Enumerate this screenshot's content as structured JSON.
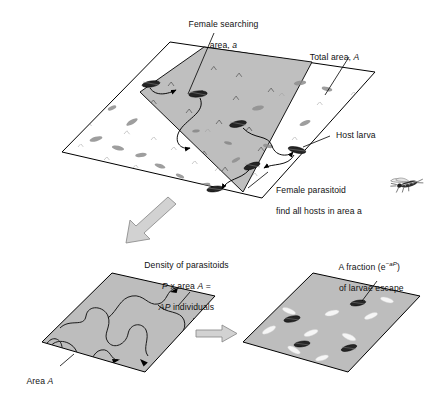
{
  "figure": {
    "title_hidden": "",
    "domain": "scientific-diagram",
    "colors": {
      "background": "#ffffff",
      "line": "#000000",
      "plane_fill_light": "#ffffff",
      "plane_fill_shaded": "#b9b9b9",
      "plane_fill_mid": "#bdbdbd",
      "arrow_fill": "#d0d0d0",
      "arrow_stroke": "#7a7a7a",
      "larva_dark": "#2a2a2a",
      "larva_light": "#f4f4f4",
      "larva_grey": "#9a9a9a"
    }
  },
  "labels": {
    "female_searching_line1": "Female searching",
    "female_searching_line2_pre": "area, ",
    "female_searching_line2_var": "a",
    "total_area_pre": "Total area, ",
    "total_area_var": "A",
    "host_larva": "Host larva",
    "female_parasitoid_line1": "Female parasitoid",
    "female_parasitoid_line2": "find all hosts in area a",
    "density_line1": "Density of parasitoids",
    "density_line2_var1": "P",
    "density_line2_mid": " x area ",
    "density_line2_var2": "A",
    "density_line2_end": " =",
    "density_line3_var": "AP",
    "density_line3_end": " individuals",
    "area_a_pre": "Area ",
    "area_a_var": "A",
    "fraction_line1_pre": "A fraction (e",
    "fraction_line1_sup": "−aP",
    "fraction_line1_post": ")",
    "fraction_line2": "of larvae escape"
  },
  "panels": {
    "top": {
      "name": "total-area-plane",
      "description": "Large tilted parallelogram representing total area A, speckled with host larvae; an inner darker shaded band represents the female searching area a with a meandering search track and arrowheads.",
      "shaded_subarea_label": "a",
      "outer_label": "A"
    },
    "bottom_left": {
      "name": "search-path-plane",
      "description": "Shaded parallelogram of area A containing a long meandering random-search path with three arrowheads.",
      "label": "Area A"
    },
    "bottom_right": {
      "name": "outcome-plane",
      "description": "Shaded parallelogram containing dark parasitized larvae and white escaped larvae.",
      "dark_larvae_count": 4,
      "light_larvae_count": 9
    }
  },
  "arrows": {
    "diagonal_down_left": "process-arrow-down",
    "horizontal_right": "process-arrow-right"
  },
  "icons": {
    "wasp": "wasp-icon",
    "larva": "larva-icon",
    "arrowhead": "arrowhead-icon"
  }
}
